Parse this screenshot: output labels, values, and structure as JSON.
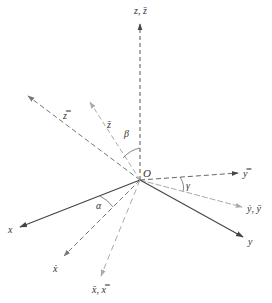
{
  "diagram": {
    "title": "",
    "origin": {
      "label": "O",
      "x": 140,
      "y": 180
    },
    "axes": [
      {
        "id": "z",
        "label": "z, z̄",
        "style": "dashed",
        "color": "#555555",
        "end": [
          140,
          22
        ],
        "label_pos": [
          134,
          14
        ]
      },
      {
        "id": "z-double-bar",
        "label": "z̿",
        "style": "dashed",
        "color": "#777777",
        "end": [
          26,
          95
        ],
        "label_pos": [
          63,
          117
        ]
      },
      {
        "id": "z-bar",
        "label": "z̄",
        "style": "dashed",
        "color": "#aaaaaa",
        "end": [
          89,
          101
        ],
        "label_pos": [
          107,
          126
        ]
      },
      {
        "id": "y-double-bar",
        "label": "y̿",
        "style": "dashed",
        "color": "#666666",
        "end": [
          240,
          173
        ],
        "label_pos": [
          243,
          177
        ]
      },
      {
        "id": "y-dot-y-bar",
        "label": "ẏ, ȳ",
        "style": "dashed",
        "color": "#aaaaaa",
        "end": [
          244,
          207
        ],
        "label_pos": [
          247,
          212
        ]
      },
      {
        "id": "y",
        "label": "y",
        "style": "solid",
        "color": "#444444",
        "end": [
          245,
          238
        ],
        "label_pos": [
          248,
          245
        ]
      },
      {
        "id": "x",
        "label": "x",
        "style": "solid",
        "color": "#444444",
        "end": [
          18,
          228
        ],
        "label_pos": [
          9,
          233
        ]
      },
      {
        "id": "x-dot",
        "label": "ẋ",
        "style": "dashed",
        "color": "#777777",
        "end": [
          63,
          257
        ],
        "label_pos": [
          53,
          270
        ]
      },
      {
        "id": "x-bar-x-double-bar",
        "label": "x̄, x̿",
        "style": "dashed",
        "color": "#aaaaaa",
        "end": [
          101,
          277
        ],
        "label_pos": [
          92,
          291
        ]
      }
    ],
    "angles": [
      {
        "label": "α",
        "label_pos": [
          96,
          206
        ]
      },
      {
        "label": "β",
        "label_pos": [
          124,
          135
        ]
      },
      {
        "label": "γ",
        "label_pos": [
          187,
          188
        ]
      }
    ]
  }
}
